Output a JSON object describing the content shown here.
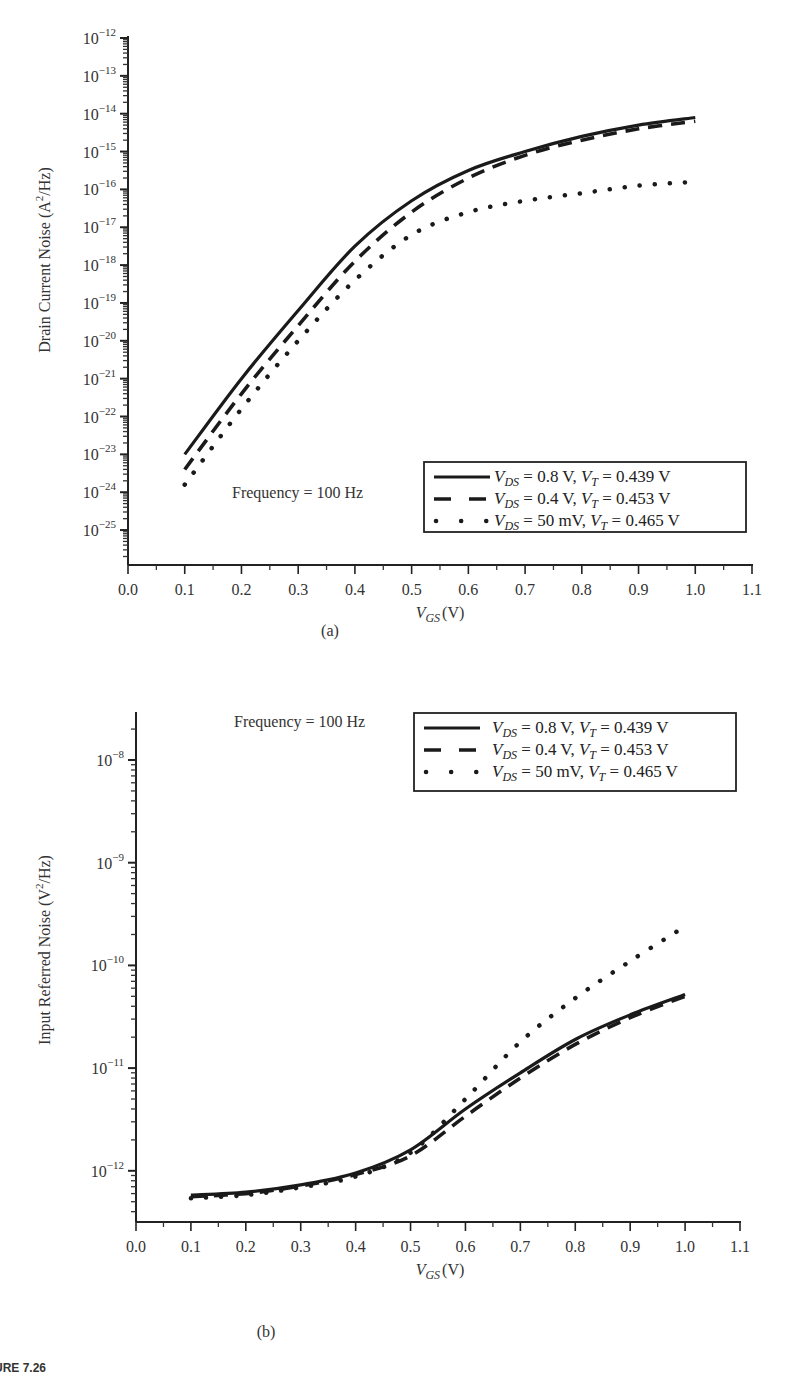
{
  "figure": {
    "caption_fragment": "URE 7.26"
  },
  "chart_data": [
    {
      "type": "line",
      "panel_label": "(a)",
      "title": "",
      "xlabel": "V_GS (V)",
      "xlabel_main": "V",
      "xlabel_sub": "GS",
      "xlabel_unit": "(V)",
      "ylabel": "Drain Current Noise (A^2/Hz)",
      "ylabel_parts": [
        "Drain Current Noise (A",
        "2",
        "/Hz)"
      ],
      "yscale": "log",
      "xlim": [
        0.0,
        1.1
      ],
      "ylim": [
        1e-26,
        1e-12
      ],
      "x_ticks": [
        "0.0",
        "0.1",
        "0.2",
        "0.3",
        "0.4",
        "0.5",
        "0.6",
        "0.7",
        "0.8",
        "0.9",
        "1.0",
        "1.1"
      ],
      "y_ticks": [
        {
          "base": "10",
          "exp": "−12"
        },
        {
          "base": "10",
          "exp": "−13"
        },
        {
          "base": "10",
          "exp": "−14"
        },
        {
          "base": "10",
          "exp": "−15"
        },
        {
          "base": "10",
          "exp": "−16"
        },
        {
          "base": "10",
          "exp": "−17"
        },
        {
          "base": "10",
          "exp": "−18"
        },
        {
          "base": "10",
          "exp": "−19"
        },
        {
          "base": "10",
          "exp": "−20"
        },
        {
          "base": "10",
          "exp": "−21"
        },
        {
          "base": "10",
          "exp": "−22"
        },
        {
          "base": "10",
          "exp": "−23"
        },
        {
          "base": "10",
          "exp": "−24"
        },
        {
          "base": "10",
          "exp": "−25"
        }
      ],
      "annotation": "Frequency = 100 Hz",
      "legend_position": "lower right",
      "x": [
        0.1,
        0.2,
        0.3,
        0.4,
        0.5,
        0.6,
        0.7,
        0.8,
        0.9,
        1.0
      ],
      "series": [
        {
          "name": "V_DS = 0.8 V, V_T = 0.439 V",
          "style": "solid",
          "label_parts": {
            "vds": "0.8 V",
            "vt": "0.439 V"
          },
          "log10_values": [
            -23.0,
            -21.0,
            -19.2,
            -17.5,
            -16.3,
            -15.5,
            -15.0,
            -14.6,
            -14.3,
            -14.1
          ]
        },
        {
          "name": "V_DS = 0.4 V, V_T = 0.453 V",
          "style": "dashed",
          "label_parts": {
            "vds": "0.4 V",
            "vt": "0.453 V"
          },
          "log10_values": [
            -23.4,
            -21.4,
            -19.6,
            -17.9,
            -16.6,
            -15.7,
            -15.1,
            -14.7,
            -14.4,
            -14.2
          ]
        },
        {
          "name": "V_DS = 50 mV, V_T = 0.465 V",
          "style": "dotted",
          "label_parts": {
            "vds": "50 mV",
            "vt": "0.465 V"
          },
          "log10_values": [
            -23.8,
            -21.8,
            -20.0,
            -18.4,
            -17.2,
            -16.6,
            -16.3,
            -16.1,
            -15.9,
            -15.8
          ]
        }
      ]
    },
    {
      "type": "line",
      "panel_label": "(b)",
      "title": "",
      "xlabel": "V_GS (V)",
      "xlabel_main": "V",
      "xlabel_sub": "GS",
      "xlabel_unit": "(V)",
      "ylabel": "Input Referred Noise (V^2/Hz)",
      "ylabel_parts": [
        "Input Referred Noise (V",
        "2",
        "/Hz)"
      ],
      "yscale": "log",
      "xlim": [
        0.0,
        1.1
      ],
      "ylim": [
        3e-13,
        4e-08
      ],
      "x_ticks": [
        "0.0",
        "0.1",
        "0.2",
        "0.3",
        "0.4",
        "0.5",
        "0.6",
        "0.7",
        "0.8",
        "0.9",
        "1.0",
        "1.1"
      ],
      "y_ticks": [
        {
          "base": "10",
          "exp": "−8"
        },
        {
          "base": "10",
          "exp": "−9"
        },
        {
          "base": "10",
          "exp": "−10"
        },
        {
          "base": "10",
          "exp": "−11"
        },
        {
          "base": "10",
          "exp": "−12"
        }
      ],
      "annotation": "Frequency = 100 Hz",
      "legend_position": "upper right",
      "x": [
        0.1,
        0.2,
        0.3,
        0.4,
        0.5,
        0.6,
        0.7,
        0.8,
        0.9,
        1.0
      ],
      "series": [
        {
          "name": "V_DS = 0.8 V, V_T = 0.439 V",
          "style": "solid",
          "label_parts": {
            "vds": "0.8 V",
            "vt": "0.439 V"
          },
          "values": [
            5.8e-13,
            6.2e-13,
            7.3e-13,
            9.5e-13,
            1.6e-12,
            4e-12,
            9e-12,
            1.9e-11,
            3.3e-11,
            5.2e-11
          ]
        },
        {
          "name": "V_DS = 0.4 V, V_T = 0.453 V",
          "style": "dashed",
          "label_parts": {
            "vds": "0.4 V",
            "vt": "0.453 V"
          },
          "values": [
            5.6e-13,
            6e-13,
            7.1e-13,
            9.2e-13,
            1.4e-12,
            3.4e-12,
            8e-12,
            1.7e-11,
            3.1e-11,
            5e-11
          ]
        },
        {
          "name": "V_DS = 50 mV, V_T = 0.465 V",
          "style": "dotted",
          "label_parts": {
            "vds": "50 mV",
            "vt": "0.465 V"
          },
          "values": [
            5.4e-13,
            5.8e-13,
            6.9e-13,
            8.8e-13,
            1.5e-12,
            5e-12,
            1.8e-11,
            4.8e-11,
            1.1e-10,
            2.4e-10
          ]
        }
      ]
    }
  ]
}
